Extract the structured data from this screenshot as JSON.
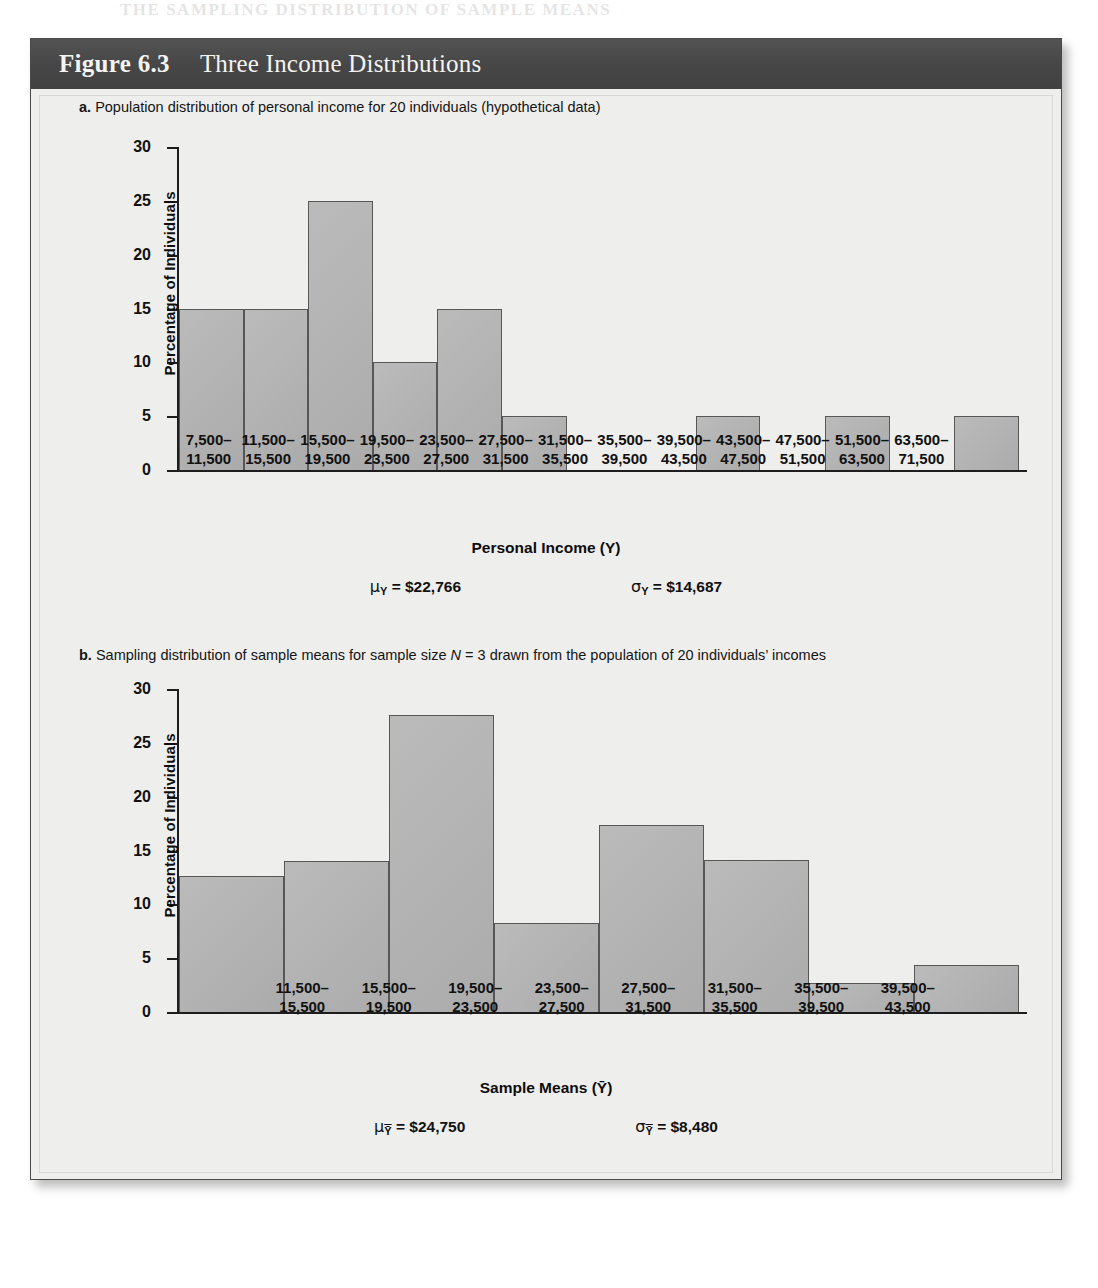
{
  "page": {
    "top_bleed_text": "THE SAMPLING DISTRIBUTION OF SAMPLE MEANS"
  },
  "figure": {
    "number_label": "Figure 6.3",
    "title": "Three Income Distributions",
    "header_bg": "#4b4b4b",
    "header_text_color": "#f4f4f2",
    "panel_bg": "#eeeeed",
    "bar_fill": "#b3b3b3",
    "bar_stroke": "#575757",
    "axis_color": "#1d1d1d"
  },
  "panels": [
    {
      "letter": "a.",
      "caption_text": "Population distribution of personal income for 20 individuals (hypothetical data)",
      "x_axis_title": "Personal Income (Y)",
      "stat_mean_label": "μ",
      "stat_mean_sub": "Y",
      "stat_mean_value": "= $22,766",
      "stat_sd_label": "σ",
      "stat_sd_sub": "Y",
      "stat_sd_value": "= $14,687"
    },
    {
      "letter": "b.",
      "caption_prefix": "Sampling distribution of sample means for sample size ",
      "caption_italic_n": "N",
      "caption_mid": " = 3 drawn from the population of 20 individuals’ incomes",
      "x_axis_title": "Sample Means (Ȳ)",
      "stat_mean_label": "μ",
      "stat_mean_sub": "Ȳ",
      "stat_mean_value": "= $24,750",
      "stat_sd_label": "σ",
      "stat_sd_sub": "Ȳ",
      "stat_sd_value": "= $8,480"
    }
  ],
  "chart_data": [
    {
      "type": "bar",
      "title": "a. Population distribution of personal income for 20 individuals (hypothetical data)",
      "xlabel": "Personal Income (Y)",
      "ylabel": "Percentage of Individuals",
      "ylim": [
        0,
        30
      ],
      "yticks": [
        0,
        5,
        10,
        15,
        20,
        25,
        30
      ],
      "ytick_labels": [
        "0",
        "5",
        "10",
        "15",
        "20",
        "25",
        "30"
      ],
      "grid": false,
      "legend": "none",
      "categories": [
        "7,500–\n11,500",
        "11,500–\n15,500",
        "15,500–\n19,500",
        "19,500–\n23,500",
        "23,500–\n27,500",
        "27,500–\n31,500",
        "31,500–\n35,500",
        "35,500–\n39,500",
        "39,500–\n43,500",
        "43,500–\n47,500",
        "47,500–\n51,500",
        "51,500–\n63,500",
        "63,500–\n71,500"
      ],
      "category_lines": [
        [
          "7,500–",
          "11,500"
        ],
        [
          "11,500–",
          "15,500"
        ],
        [
          "15,500–",
          "19,500"
        ],
        [
          "19,500–",
          "23,500"
        ],
        [
          "23,500–",
          "27,500"
        ],
        [
          "27,500–",
          "31,500"
        ],
        [
          "31,500–",
          "35,500"
        ],
        [
          "35,500–",
          "39,500"
        ],
        [
          "39,500–",
          "43,500"
        ],
        [
          "43,500–",
          "47,500"
        ],
        [
          "47,500–",
          "51,500"
        ],
        [
          "51,500–",
          "63,500"
        ],
        [
          "63,500–",
          "71,500"
        ]
      ],
      "values": [
        15,
        15,
        25,
        10,
        15,
        5,
        0,
        0,
        5,
        0,
        5,
        0,
        5
      ],
      "annotations": {
        "mean": "μY = $22,766",
        "std_dev": "σY = $14,687"
      }
    },
    {
      "type": "bar",
      "title": "b. Sampling distribution of sample means for sample size N = 3 drawn from the population of 20 individuals’ incomes",
      "xlabel": "Sample Means (Ȳ)",
      "ylabel": "Percentage of Individuals",
      "ylim": [
        0,
        30
      ],
      "yticks": [
        0,
        5,
        10,
        15,
        20,
        25,
        30
      ],
      "ytick_labels": [
        "0",
        "5",
        "10",
        "15",
        "20",
        "25",
        "30"
      ],
      "grid": false,
      "legend": "none",
      "categories": [
        "11,500–\n15,500",
        "15,500–\n19,500",
        "19,500–\n23,500",
        "23,500–\n27,500",
        "27,500–\n31,500",
        "31,500–\n35,500",
        "35,500–\n39,500",
        "39,500–\n43,500"
      ],
      "category_lines": [
        [
          "11,500–",
          "15,500"
        ],
        [
          "15,500–",
          "19,500"
        ],
        [
          "19,500–",
          "23,500"
        ],
        [
          "23,500–",
          "27,500"
        ],
        [
          "27,500–",
          "31,500"
        ],
        [
          "31,500–",
          "35,500"
        ],
        [
          "35,500–",
          "39,500"
        ],
        [
          "39,500–",
          "43,500"
        ]
      ],
      "values": [
        12.6,
        14.0,
        27.6,
        8.3,
        17.4,
        14.1,
        2.7,
        4.4
      ],
      "annotations": {
        "mean": "μȲ = $24,750",
        "std_dev": "σȲ = $8,480"
      }
    }
  ]
}
